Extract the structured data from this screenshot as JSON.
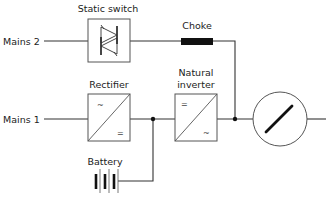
{
  "diagram": {
    "title": "",
    "type": "UPS block diagram",
    "inputs": [
      {
        "id": "mains2",
        "label": "Mains 2"
      },
      {
        "id": "mains1",
        "label": "Mains 1"
      }
    ],
    "components": [
      {
        "id": "static_switch",
        "label": "Static switch",
        "symbol": "thyristor-pair-icon"
      },
      {
        "id": "choke",
        "label": "Choke",
        "symbol": "inductor-block-icon"
      },
      {
        "id": "rectifier",
        "label": "Rectifier",
        "symbol": "ac-dc-converter-icon",
        "in_symbol": "~",
        "out_symbol": "="
      },
      {
        "id": "inverter",
        "label_line1": "Natural",
        "label_line2": "inverter",
        "symbol": "dc-ac-converter-icon",
        "in_symbol": "=",
        "out_symbol": "~"
      },
      {
        "id": "battery",
        "label": "Battery",
        "symbol": "battery-icon"
      },
      {
        "id": "load",
        "label": "",
        "symbol": "load-circle-icon"
      }
    ],
    "connections": [
      {
        "from": "mains2",
        "to": "static_switch"
      },
      {
        "from": "static_switch",
        "to": "choke"
      },
      {
        "from": "choke",
        "to": "output_junction"
      },
      {
        "from": "mains1",
        "to": "rectifier"
      },
      {
        "from": "rectifier",
        "to": "dc_junction"
      },
      {
        "from": "battery",
        "to": "dc_junction"
      },
      {
        "from": "dc_junction",
        "to": "inverter"
      },
      {
        "from": "inverter",
        "to": "output_junction"
      },
      {
        "from": "output_junction",
        "to": "load"
      }
    ]
  }
}
